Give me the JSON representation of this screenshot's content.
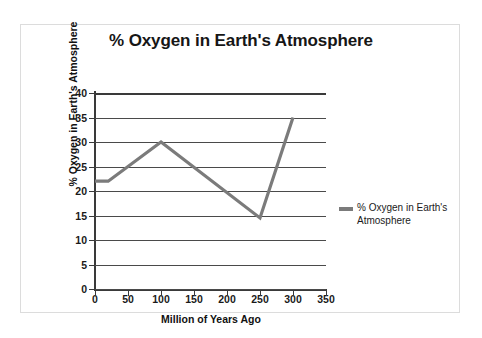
{
  "chart_data": {
    "type": "line",
    "title": "% Oxygen in Earth's Atmosphere",
    "xlabel": "Million of Years Ago",
    "ylabel": "% Oxygen in Earth's Atmosphere",
    "xlim": [
      0,
      350
    ],
    "ylim": [
      0,
      40
    ],
    "xticks": [
      0,
      50,
      100,
      150,
      200,
      250,
      300,
      350
    ],
    "yticks": [
      0,
      5,
      10,
      15,
      20,
      25,
      30,
      35,
      40
    ],
    "grid": true,
    "legend_position": "right",
    "line_color": "#7b7b7b",
    "series": [
      {
        "name": "% Oxygen in Earth's Atmosphere",
        "x": [
          0,
          20,
          100,
          250,
          300
        ],
        "values": [
          22,
          22,
          30,
          14.5,
          35
        ]
      }
    ]
  },
  "legend": {
    "entries": [
      {
        "label": "% Oxygen in Earth's Atmosphere",
        "color": "#7b7b7b"
      }
    ]
  }
}
